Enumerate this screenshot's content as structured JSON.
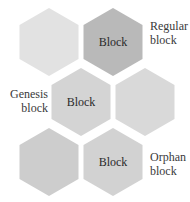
{
  "diagram": {
    "title": "",
    "hexagons": [
      {
        "id": "hex-top-left",
        "label": "",
        "cx": 49,
        "cy": 42,
        "fill": "#e2e2e2"
      },
      {
        "id": "hex-top-right",
        "label": "Block",
        "cx": 113,
        "cy": 42,
        "fill": "#b9b9b9"
      },
      {
        "id": "hex-middle-left",
        "label": "Block",
        "cx": 81,
        "cy": 102,
        "fill": "#d4d4d4"
      },
      {
        "id": "hex-middle-right",
        "label": "",
        "cx": 145,
        "cy": 102,
        "fill": "#d9d9d9"
      },
      {
        "id": "hex-bottom-left",
        "label": "",
        "cx": 49,
        "cy": 162,
        "fill": "#cdcdcd"
      },
      {
        "id": "hex-bottom-right",
        "label": "Block",
        "cx": 113,
        "cy": 162,
        "fill": "#d2d2d2"
      }
    ],
    "annotations": {
      "regular": {
        "line1": "Regular",
        "line2": "block"
      },
      "genesis": {
        "line1": "Genesis",
        "line2": "block"
      },
      "orphan": {
        "line1": "Orphan",
        "line2": "block"
      }
    },
    "colors": {
      "background": "#ffffff",
      "text": "#2a2a2a"
    }
  }
}
